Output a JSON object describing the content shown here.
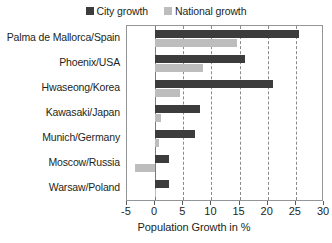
{
  "chart_data": {
    "type": "bar",
    "orientation": "horizontal",
    "title": "",
    "xlabel": "Population Growth in %",
    "ylabel": "",
    "xlim": [
      -5,
      30
    ],
    "xticks": [
      -5,
      0,
      5,
      10,
      15,
      20,
      25,
      30
    ],
    "xtick_labels": [
      "-5",
      "0",
      "5",
      "10",
      "15",
      "20",
      "25",
      "30"
    ],
    "grid": true,
    "grid_axis": "x",
    "grid_style": "dashed",
    "legend_position": "top-center",
    "categories": [
      "Palma de Mallorca/Spain",
      "Phoenix/USA",
      "Hwaseong/Korea",
      "Kawasaki/Japan",
      "Munich/Germany",
      "Moscow/Russia",
      "Warsaw/Poland"
    ],
    "series": [
      {
        "name": "City growth",
        "color": "#3c3c3c",
        "values": [
          25.5,
          16.0,
          21.0,
          8.0,
          7.0,
          2.5,
          2.5
        ]
      },
      {
        "name": "National growth",
        "color": "#bdbdbd",
        "values": [
          14.5,
          8.5,
          4.5,
          1.0,
          0.6,
          -3.5,
          0.2
        ]
      }
    ]
  },
  "legend": {
    "entries": [
      {
        "label": "City growth",
        "swatch": "legend-swatch-city",
        "color": "#3c3c3c"
      },
      {
        "label": "National growth",
        "swatch": "legend-swatch-national",
        "color": "#bdbdbd"
      }
    ]
  },
  "axis": {
    "x_title": "Population Growth in %"
  }
}
